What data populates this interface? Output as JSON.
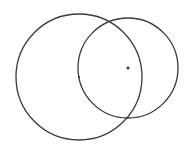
{
  "diagram": {
    "background": "#ffffff",
    "stroke_color": "#3a3a3a",
    "circles": [
      {
        "name": "large-circle",
        "cx": 79,
        "cy": 77,
        "r": 63
      },
      {
        "name": "small-circle",
        "cx": 128,
        "cy": 68,
        "r": 50
      }
    ],
    "center_points": [
      {
        "name": "large-circle-center",
        "x": 79,
        "y": 77,
        "size": 1
      },
      {
        "name": "small-circle-center",
        "x": 128,
        "y": 68,
        "size": 1.5
      }
    ]
  }
}
